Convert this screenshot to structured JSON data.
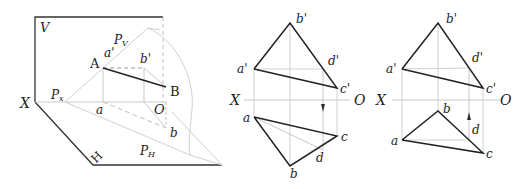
{
  "figure_left": {
    "title": "3D projection of line AB on plane P",
    "labels": {
      "V": "V",
      "H": "H",
      "X": "X",
      "O": "O",
      "A": "A",
      "B": "B",
      "a_prime": "a'",
      "b_prime": "b'",
      "a": "a",
      "b": "b",
      "Pv": "P",
      "Pv_sub": "V",
      "Px": "P",
      "Px_sub": "x",
      "PH": "P",
      "PH_sub": "H"
    }
  },
  "figure_middle": {
    "labels": {
      "X": "X",
      "O": "O",
      "a_prime": "a'",
      "b_prime": "b'",
      "c_prime": "c'",
      "d_prime": "d'",
      "a": "a",
      "b": "b",
      "c": "c",
      "d": "d"
    }
  },
  "figure_right": {
    "labels": {
      "X": "X",
      "O": "O",
      "a_prime": "a'",
      "b_prime": "b'",
      "c_prime": "c'",
      "d_prime": "d'",
      "a": "a",
      "b": "b",
      "c": "c",
      "d": "d"
    }
  },
  "colors": {
    "line_dark": "#222222",
    "line_light": "#c8c8c8",
    "line_dashed": "#b0b0b0"
  }
}
